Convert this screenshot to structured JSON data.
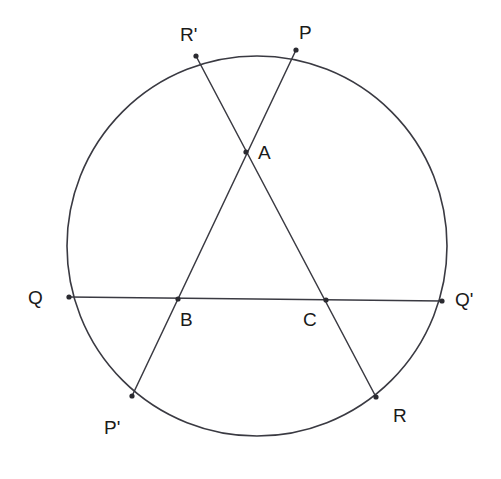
{
  "figure": {
    "type": "geometry-diagram",
    "background_color": "#ffffff",
    "stroke_color": "#3a3a42",
    "label_color": "#1a1a1a",
    "canvas": {
      "width": 501,
      "height": 479
    }
  },
  "circle": {
    "name": "main-circle",
    "center_x": 257,
    "center_y": 246,
    "radius": 190,
    "stroke_width": 1.6
  },
  "points": [
    {
      "id": "P",
      "label": "P",
      "x": 296,
      "y": 50,
      "label_x": 299,
      "label_y": 23,
      "on_circle": true,
      "marker": true
    },
    {
      "id": "Rp",
      "label": "R'",
      "x": 196,
      "y": 56,
      "label_x": 180,
      "label_y": 25,
      "on_circle": true,
      "marker": true
    },
    {
      "id": "A",
      "label": "A",
      "x": 246,
      "y": 152,
      "label_x": 258,
      "label_y": 143,
      "on_circle": false,
      "marker": true
    },
    {
      "id": "Q",
      "label": "Q",
      "x": 69,
      "y": 297,
      "label_x": 28,
      "label_y": 288,
      "on_circle": true,
      "marker": true
    },
    {
      "id": "B",
      "label": "B",
      "x": 178,
      "y": 299,
      "label_x": 180,
      "label_y": 310,
      "on_circle": false,
      "marker": true
    },
    {
      "id": "C",
      "label": "C",
      "x": 326,
      "y": 300,
      "label_x": 303,
      "label_y": 310,
      "on_circle": false,
      "marker": true
    },
    {
      "id": "Qp",
      "label": "Q'",
      "x": 442,
      "y": 301,
      "label_x": 455,
      "label_y": 290,
      "on_circle": true,
      "marker": true
    },
    {
      "id": "Pp",
      "label": "P'",
      "x": 132,
      "y": 396,
      "label_x": 104,
      "label_y": 418,
      "on_circle": true,
      "marker": true
    },
    {
      "id": "R",
      "label": "R",
      "x": 376,
      "y": 397,
      "label_x": 393,
      "label_y": 406,
      "on_circle": true,
      "marker": true
    }
  ],
  "segments": [
    {
      "id": "PP-prime",
      "name": "chord-P-Pprime",
      "from": "P",
      "to": "Pp",
      "x1": 296,
      "y1": 50,
      "x2": 132,
      "y2": 396
    },
    {
      "id": "Rprime-R",
      "name": "chord-Rprime-R",
      "from": "Rp",
      "to": "R",
      "x1": 196,
      "y1": 56,
      "x2": 376,
      "y2": 397
    },
    {
      "id": "QQ-prime",
      "name": "chord-Q-Qprime",
      "from": "Q",
      "to": "Qp",
      "x1": 69,
      "y1": 297,
      "x2": 442,
      "y2": 301
    }
  ],
  "chart_data": {
    "type": "scatter",
    "xlabel": "",
    "ylabel": "",
    "xlim": [
      0,
      501
    ],
    "ylim": [
      0,
      479
    ],
    "grid": false,
    "legend": "none",
    "annotations": [
      "P",
      "R'",
      "A",
      "Q",
      "B",
      "C",
      "Q'",
      "P'",
      "R"
    ],
    "series": [
      {
        "name": "circle-outline",
        "kind": "circle",
        "center": [
          257,
          246
        ],
        "radius": 190
      },
      {
        "name": "chord-P-Pprime",
        "kind": "line",
        "x": [
          296,
          132
        ],
        "y": [
          50,
          396
        ]
      },
      {
        "name": "chord-Rprime-R",
        "kind": "line",
        "x": [
          196,
          376
        ],
        "y": [
          56,
          397
        ]
      },
      {
        "name": "chord-Q-Qprime",
        "kind": "line",
        "x": [
          69,
          442
        ],
        "y": [
          297,
          301
        ]
      },
      {
        "name": "labeled-points",
        "kind": "points",
        "labels": [
          "P",
          "R'",
          "A",
          "Q",
          "B",
          "C",
          "Q'",
          "P'",
          "R"
        ],
        "x": [
          296,
          196,
          246,
          69,
          178,
          326,
          442,
          132,
          376
        ],
        "y": [
          50,
          56,
          152,
          297,
          299,
          300,
          301,
          396,
          397
        ]
      }
    ]
  }
}
